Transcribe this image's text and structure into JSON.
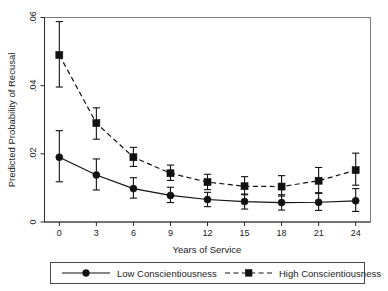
{
  "chart_data": {
    "type": "line",
    "title": "",
    "xlabel": "Years of Service",
    "ylabel": "Predicted Probability of Recusal",
    "x": [
      0,
      3,
      6,
      9,
      12,
      15,
      18,
      21,
      24
    ],
    "xtick_labels": [
      "0",
      "3",
      "6",
      "9",
      "12",
      "15",
      "18",
      "21",
      "24"
    ],
    "ytick_labels": [
      "0",
      ".02",
      ".04",
      ".06"
    ],
    "ytick_values": [
      0,
      0.02,
      0.04,
      0.06
    ],
    "xlim": [
      -1.2,
      25.2
    ],
    "ylim": [
      0,
      0.06
    ],
    "grid": false,
    "legend_position": "below-axes",
    "series": [
      {
        "name": "Low Conscientiousness",
        "marker": "circle",
        "linestyle": "solid",
        "color": "#111111",
        "values": [
          0.019,
          0.0138,
          0.0098,
          0.0078,
          0.0066,
          0.006,
          0.0057,
          0.0058,
          0.0062
        ],
        "ci_lower": [
          0.0118,
          0.0094,
          0.007,
          0.0057,
          0.0045,
          0.0038,
          0.0035,
          0.0034,
          0.0031
        ],
        "ci_upper": [
          0.0268,
          0.0185,
          0.013,
          0.0102,
          0.0087,
          0.0082,
          0.008,
          0.0086,
          0.0098
        ]
      },
      {
        "name": "High Conscientiousness",
        "marker": "square",
        "linestyle": "dashed",
        "color": "#111111",
        "values": [
          0.049,
          0.029,
          0.019,
          0.0143,
          0.0117,
          0.0105,
          0.0104,
          0.0121,
          0.0152
        ],
        "ci_lower": [
          0.0396,
          0.0243,
          0.0163,
          0.0122,
          0.0095,
          0.008,
          0.0076,
          0.0084,
          0.0108
        ],
        "ci_upper": [
          0.0588,
          0.0335,
          0.0219,
          0.0167,
          0.014,
          0.0133,
          0.0136,
          0.016,
          0.0202
        ]
      }
    ]
  },
  "legend": {
    "entries": [
      {
        "label": "Low Conscientiousness",
        "marker": "circle",
        "linestyle": "solid"
      },
      {
        "label": "High Conscientiousness",
        "marker": "square",
        "linestyle": "dashed"
      }
    ]
  }
}
